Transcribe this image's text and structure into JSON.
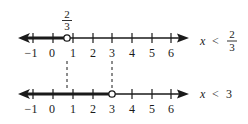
{
  "diagram": {
    "colors": {
      "ink": "#1a1a1a",
      "background": "#ffffff"
    },
    "number_lines": [
      {
        "id": "top",
        "ticks": [
          -1,
          0,
          1,
          2,
          3,
          4,
          5,
          6
        ],
        "tick_labels": [
          "−1",
          "0",
          "1",
          "2",
          "3",
          "4",
          "5",
          "6"
        ],
        "endpoint": {
          "value": "2/3",
          "numerator": "2",
          "denominator": "3",
          "open": true
        },
        "shaded_direction": "left",
        "inequality": {
          "variable": "x",
          "operator": "<",
          "rhs_numerator": "2",
          "rhs_denominator": "3"
        }
      },
      {
        "id": "bottom",
        "ticks": [
          -1,
          0,
          1,
          2,
          3,
          4,
          5,
          6
        ],
        "tick_labels": [
          "−1",
          "0",
          "1",
          "2",
          "3",
          "4",
          "5",
          "6"
        ],
        "endpoint": {
          "value": "3",
          "open": true
        },
        "shaded_direction": "left",
        "inequality": {
          "variable": "x",
          "operator": "<",
          "rhs": "3"
        }
      }
    ],
    "dashed_connectors": [
      "2/3",
      "3"
    ]
  }
}
